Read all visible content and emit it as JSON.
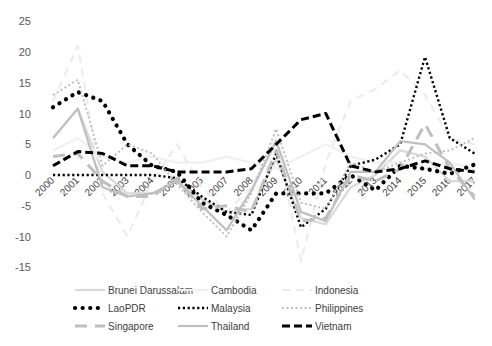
{
  "chart_data": {
    "type": "line",
    "title": "",
    "xlabel": "",
    "ylabel": "",
    "ylim": [
      -15,
      25
    ],
    "yticks": [
      25,
      20,
      15,
      10,
      5,
      0,
      -5,
      -10,
      -15
    ],
    "grid": false,
    "legend_position": "bottom",
    "x": [
      "2000",
      "2001",
      "2002",
      "2003",
      "2004",
      "2005",
      "2006",
      "2007",
      "2008",
      "2009",
      "2010",
      "2011",
      "2012",
      "2013",
      "2014",
      "2015",
      "2016",
      "2017"
    ],
    "series": [
      {
        "name": "Brunei Darussalam",
        "style": "solid-light",
        "color": "#d9d9d9",
        "values": [
          6,
          10.8,
          0.5,
          -3,
          -3,
          -1,
          -4,
          -6,
          -5.5,
          2.5,
          -7,
          -8,
          -2,
          0,
          4,
          3,
          -1,
          -1
        ]
      },
      {
        "name": "Cambodia",
        "style": "solid-faint",
        "color": "#f0f0f0",
        "values": [
          4,
          6,
          3,
          2,
          3,
          2,
          2,
          3,
          2,
          1,
          3,
          5,
          3,
          2,
          2,
          1,
          2,
          1
        ]
      },
      {
        "name": "Indonesia",
        "style": "dash-faint",
        "color": "#ececec",
        "values": [
          12,
          21,
          -3,
          -10,
          -1,
          5,
          -2,
          -6,
          -2,
          6,
          -14,
          2,
          12,
          14,
          17,
          13,
          6,
          5
        ]
      },
      {
        "name": "LaoPDR",
        "style": "round-dot",
        "color": "#000000",
        "values": [
          11,
          13.5,
          12,
          5,
          1.5,
          0.5,
          -4.5,
          -6.5,
          -9,
          -3,
          -3,
          -3,
          0,
          -2.5,
          1.5,
          1,
          0.2,
          1.7
        ]
      },
      {
        "name": "Malaysia",
        "style": "square-dot",
        "color": "#000000",
        "values": [
          0,
          0,
          0,
          0,
          0,
          -0.5,
          -3.5,
          -6,
          -6.5,
          3.5,
          -8.5,
          -5.5,
          1.5,
          2.5,
          5,
          19.2,
          6,
          3.5
        ]
      },
      {
        "name": "Philippines",
        "style": "dotted-light",
        "color": "#bfbfbf",
        "values": [
          13,
          15.5,
          1.5,
          5,
          3.5,
          -1.5,
          -6,
          -10,
          -3,
          7.5,
          -4.5,
          -5.5,
          2,
          0.5,
          2,
          3.5,
          4,
          6
        ]
      },
      {
        "name": "Singapore",
        "style": "long-dash-light",
        "color": "#bfbfbf",
        "values": [
          3,
          3.5,
          -1,
          -3.5,
          -3.5,
          -0.5,
          -5.5,
          -5,
          -6,
          4,
          -7.5,
          -7,
          0,
          -1,
          1,
          8.3,
          1,
          -3.5
        ]
      },
      {
        "name": "Thailand",
        "style": "solid-light",
        "color": "#bfbfbf",
        "values": [
          6,
          10.8,
          -2,
          -3.5,
          -3,
          -1,
          -5,
          -9,
          -2.5,
          5.5,
          -6,
          -7.5,
          0.5,
          0.5,
          5.5,
          5,
          2,
          -4
        ]
      },
      {
        "name": "Vietnam",
        "style": "dash",
        "color": "#000000",
        "values": [
          1.5,
          3.8,
          3.5,
          1.5,
          1.5,
          0.5,
          0.5,
          0.5,
          1,
          5,
          9,
          10,
          1.5,
          0.5,
          1,
          2.3,
          1,
          0.5
        ]
      }
    ]
  },
  "legend": {
    "items": [
      {
        "label": "Brunei Darussalam"
      },
      {
        "label": "Cambodia"
      },
      {
        "label": "Indonesia"
      },
      {
        "label": "LaoPDR"
      },
      {
        "label": "Malaysia"
      },
      {
        "label": "Philippines"
      },
      {
        "label": "Singapore"
      },
      {
        "label": "Thailand"
      },
      {
        "label": "Vietnam"
      }
    ]
  }
}
